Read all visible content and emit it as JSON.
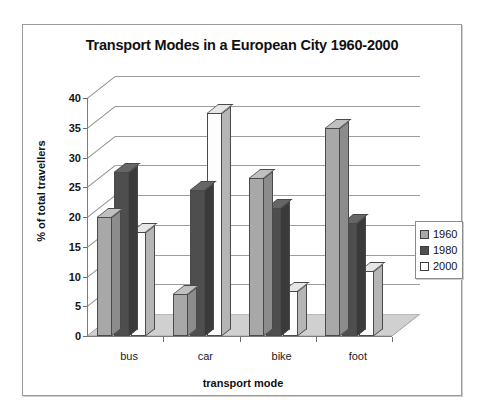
{
  "chart_data": {
    "type": "bar",
    "title": "Transport Modes in a European City 1960-2000",
    "xlabel": "transport mode",
    "ylabel": "% of total travellers",
    "categories": [
      "bus",
      "car",
      "bike",
      "foot"
    ],
    "series": [
      {
        "name": "1960",
        "values": [
          20,
          7,
          26.5,
          35
        ],
        "color": "#a8a8a8"
      },
      {
        "name": "1980",
        "values": [
          27.5,
          24.5,
          21.5,
          19
        ],
        "color": "#4e4e4e"
      },
      {
        "name": "2000",
        "values": [
          17.5,
          37.5,
          7.5,
          11
        ],
        "color": "#ffffff"
      }
    ],
    "ylim": [
      0,
      40
    ],
    "yticks": [
      "0",
      "5",
      "10",
      "15",
      "20",
      "25",
      "30",
      "35",
      "40"
    ],
    "grid": true,
    "legend_position": "right",
    "three_d": true
  },
  "legend": {
    "items": [
      {
        "label": "1960"
      },
      {
        "label": "1980"
      },
      {
        "label": "2000"
      }
    ]
  }
}
